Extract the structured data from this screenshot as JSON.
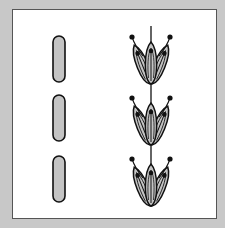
{
  "figure": {
    "background": "#c8c8c8",
    "panel_color": "#ffffff",
    "fill_color": "#c4c4c4",
    "stroke_color": "#111111",
    "left_column": {
      "label": "unopened buds",
      "count": 3,
      "pills": [
        {
          "cx": 59,
          "cy": 59,
          "w": 12,
          "h": 46
        },
        {
          "cx": 59,
          "cy": 118,
          "w": 12,
          "h": 46
        },
        {
          "cx": 59,
          "cy": 179,
          "w": 12,
          "h": 46
        }
      ]
    },
    "right_column": {
      "label": "flower clusters on stem",
      "count": 3,
      "stem_x": 151,
      "stem_top": 26,
      "stem_bottom": 207,
      "clusters": [
        {
          "base_y": 84,
          "top_y": 38
        },
        {
          "base_y": 145,
          "top_y": 99
        },
        {
          "base_y": 206,
          "top_y": 160
        }
      ]
    }
  }
}
